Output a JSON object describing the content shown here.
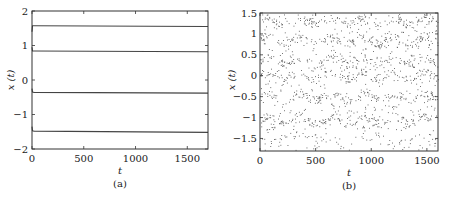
{
  "figure": {
    "panels": [
      {
        "id": "a",
        "caption": "(a)",
        "xlabel": "t",
        "ylabel": "x (t)",
        "xticks": [
          "0",
          "500",
          "1000",
          "1500"
        ],
        "yticks": [
          "2",
          "1",
          "0",
          "−1",
          "−2"
        ]
      },
      {
        "id": "b",
        "caption": "(b)",
        "xlabel": "t",
        "ylabel": "x (t)",
        "xticks": [
          "0",
          "500",
          "1000",
          "1500"
        ],
        "yticks": [
          "1.5",
          "1",
          "0.5",
          "0",
          "−0.5",
          "−1",
          "−1.5"
        ]
      }
    ]
  },
  "chart_data": [
    {
      "type": "line",
      "title": "(a)",
      "xlabel": "t",
      "ylabel": "x(t)",
      "xlim": [
        0,
        1700
      ],
      "ylim": [
        -2,
        2
      ],
      "grid": false,
      "legend": null,
      "xticks": [
        0,
        500,
        1000,
        1500
      ],
      "yticks": [
        -2,
        -1,
        0,
        1,
        2
      ],
      "series": [
        {
          "name": "trajectory 1",
          "x": [
            0,
            5,
            20,
            1700
          ],
          "values": [
            1.4,
            1.57,
            1.57,
            1.55
          ]
        },
        {
          "name": "trajectory 2",
          "x": [
            0,
            5,
            20,
            1700
          ],
          "values": [
            0.95,
            0.84,
            0.84,
            0.82
          ]
        },
        {
          "name": "trajectory 3",
          "x": [
            0,
            5,
            20,
            1700
          ],
          "values": [
            -0.25,
            -0.35,
            -0.36,
            -0.38
          ]
        },
        {
          "name": "trajectory 4",
          "x": [
            0,
            5,
            20,
            1700
          ],
          "values": [
            -1.35,
            -1.47,
            -1.48,
            -1.52
          ]
        }
      ],
      "description": "Four trajectories converge quickly to constant (steady) levels near 1.55, 0.82, -0.38, -1.52"
    },
    {
      "type": "scatter",
      "title": "(b)",
      "xlabel": "t",
      "ylabel": "x(t)",
      "xlim": [
        0,
        1600
      ],
      "ylim": [
        -1.8,
        1.5
      ],
      "grid": false,
      "legend": null,
      "xticks": [
        0,
        500,
        1000,
        1500
      ],
      "yticks": [
        -1.5,
        -1,
        -0.5,
        0,
        0.5,
        1,
        1.5
      ],
      "description": "Dense irregular (chaotic) scatter of points over the full range, with denser bands near 1.3, 0.85, 0.35, 0.0, -0.5 and -1.05",
      "bands": [
        1.3,
        0.85,
        0.35,
        0.0,
        -0.5,
        -1.05
      ],
      "points_approx": 1500
    }
  ]
}
